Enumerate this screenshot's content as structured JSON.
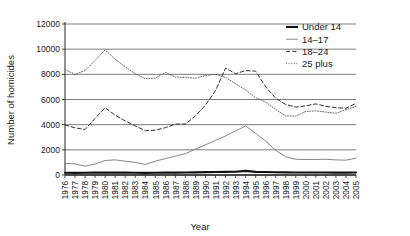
{
  "chart_data": {
    "type": "line",
    "title": "",
    "xlabel": "Year",
    "ylabel": "Number of homicides",
    "xlim": [
      1976,
      2005
    ],
    "ylim": [
      0,
      12000
    ],
    "ytick_step": 2000,
    "grid": true,
    "legend_position": "top-right",
    "x": [
      1976,
      1977,
      1978,
      1979,
      1980,
      1981,
      1982,
      1983,
      1984,
      1985,
      1986,
      1987,
      1988,
      1989,
      1990,
      1991,
      1992,
      1993,
      1994,
      1995,
      1996,
      1997,
      1998,
      1999,
      2000,
      2001,
      2002,
      2003,
      2004,
      2005
    ],
    "xtick_labels": [
      "1976",
      "1977",
      "1978",
      "1979",
      "1980",
      "1981",
      "1982",
      "1983",
      "1984",
      "1985",
      "1986",
      "1987",
      "1988",
      "1989",
      "1990",
      "1991",
      "1992",
      "1993",
      "1994",
      "1995",
      "1996",
      "1997",
      "1998",
      "1999",
      "2000",
      "2001",
      "2002",
      "2003",
      "2004",
      "2005"
    ],
    "ytick_labels": [
      "0",
      "2000",
      "4000",
      "6000",
      "8000",
      "10000",
      "12000"
    ],
    "ytick_values": [
      0,
      2000,
      4000,
      6000,
      8000,
      10000,
      12000
    ],
    "series": [
      {
        "name": "Under 14",
        "style": "solid-thick",
        "color": "#111111",
        "values": [
          180,
          170,
          175,
          185,
          190,
          190,
          185,
          175,
          170,
          175,
          185,
          190,
          195,
          205,
          225,
          240,
          245,
          255,
          330,
          250,
          235,
          215,
          205,
          195,
          195,
          195,
          195,
          190,
          190,
          195
        ]
      },
      {
        "name": "14–17",
        "style": "solid-thin",
        "color": "#808080",
        "values": [
          930,
          880,
          700,
          880,
          1150,
          1200,
          1100,
          1000,
          840,
          1100,
          1300,
          1500,
          1700,
          2050,
          2400,
          2750,
          3100,
          3500,
          3900,
          3300,
          2700,
          1950,
          1450,
          1250,
          1230,
          1230,
          1250,
          1200,
          1180,
          1330
        ]
      },
      {
        "name": "18–24",
        "style": "dashed",
        "color": "#333333",
        "values": [
          3980,
          3750,
          3620,
          4500,
          5350,
          4750,
          4300,
          3900,
          3530,
          3560,
          3760,
          4050,
          4050,
          4700,
          5550,
          6700,
          8500,
          8050,
          8300,
          8250,
          7000,
          6100,
          5600,
          5400,
          5500,
          5650,
          5450,
          5350,
          5300,
          5700
        ]
      },
      {
        "name": "25 plus",
        "style": "dotted",
        "color": "#666666",
        "values": [
          8380,
          8000,
          8300,
          9100,
          9950,
          9200,
          8600,
          8050,
          7650,
          7700,
          8150,
          7780,
          7750,
          7700,
          7900,
          8000,
          7750,
          7250,
          6750,
          6150,
          5800,
          5200,
          4700,
          4680,
          5050,
          5100,
          5000,
          4900,
          5200,
          5450
        ]
      }
    ]
  },
  "legend": {
    "entries": [
      {
        "label": "Under 14",
        "marker": "solid-thick-line-marker"
      },
      {
        "label": "14–17",
        "marker": "solid-thin-line-marker"
      },
      {
        "label": "18–24",
        "marker": "dashed-line-marker"
      },
      {
        "label": "25 plus",
        "marker": "dotted-line-marker"
      }
    ]
  }
}
